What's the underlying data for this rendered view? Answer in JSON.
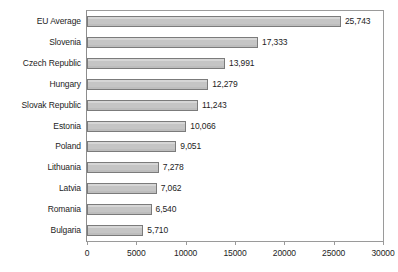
{
  "chart_data": {
    "type": "bar",
    "orientation": "horizontal",
    "title": "",
    "subtitle": "",
    "xlabel": "",
    "ylabel": "",
    "xlim": [
      0,
      30000
    ],
    "ylim": null,
    "grid": false,
    "legend": null,
    "legend_position": "none",
    "xticks": [
      0,
      5000,
      10000,
      15000,
      20000,
      25000,
      30000
    ],
    "xtick_labels": [
      "0",
      "5000",
      "10000",
      "15000",
      "20000",
      "25000",
      "30000"
    ],
    "categories": [
      "EU Average",
      "Slovenia",
      "Czech Republic",
      "Hungary",
      "Slovak Republic",
      "Estonia",
      "Poland",
      "Lithuania",
      "Latvia",
      "Romania",
      "Bulgaria"
    ],
    "values": [
      25743,
      17333,
      13991,
      12279,
      11243,
      10066,
      9051,
      7278,
      7062,
      6540,
      5710
    ],
    "data_labels": [
      "25,743",
      "17,333",
      "13,991",
      "12,279",
      "11,243",
      "10,066",
      "9,051",
      "7,278",
      "7,062",
      "6,540",
      "5,710"
    ],
    "colors": {
      "bar_fill": "#c9c9c9",
      "bar_border": "#7b7b7b",
      "axis": "#9a9a9a",
      "text": "#1d1d1d",
      "background": "#ffffff"
    }
  }
}
